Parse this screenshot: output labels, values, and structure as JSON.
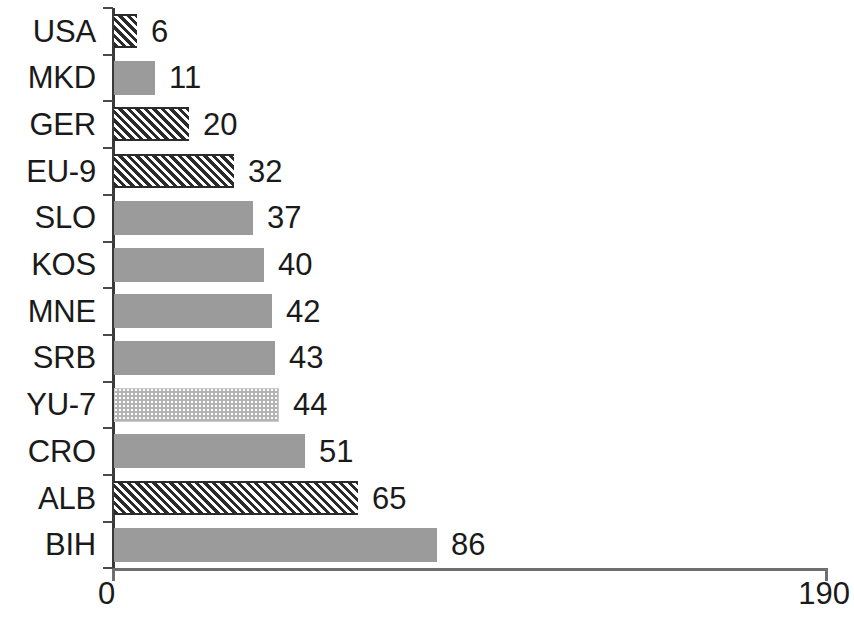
{
  "chart_data": {
    "type": "bar",
    "orientation": "horizontal",
    "title": "",
    "subtitle": "",
    "xlabel": "",
    "ylabel": "",
    "xlim": [
      0,
      190
    ],
    "grid": false,
    "legend": null,
    "axis": {
      "x_ticks": [
        0,
        190
      ],
      "x_tick_labels": [
        "0",
        "190"
      ],
      "y_tick_style": "boundary-ticks"
    },
    "categories": [
      "USA",
      "MKD",
      "GER",
      "EU-9",
      "SLO",
      "KOS",
      "MNE",
      "SRB",
      "YU-7",
      "CRO",
      "ALB",
      "BIH"
    ],
    "values": [
      6,
      11,
      20,
      32,
      37,
      40,
      42,
      43,
      44,
      51,
      65,
      86
    ],
    "value_labels": [
      "6",
      "11",
      "20",
      "32",
      "37",
      "40",
      "42",
      "43",
      "44",
      "51",
      "65",
      "86"
    ],
    "fills": [
      "hatch",
      "solid",
      "hatch",
      "hatch",
      "solid",
      "solid",
      "solid",
      "solid",
      "dots",
      "solid",
      "hatch",
      "solid"
    ],
    "bars": [
      {
        "category": "USA",
        "value": 6,
        "label": "6",
        "fill": "hatch"
      },
      {
        "category": "MKD",
        "value": 11,
        "label": "11",
        "fill": "solid"
      },
      {
        "category": "GER",
        "value": 20,
        "label": "20",
        "fill": "hatch"
      },
      {
        "category": "EU-9",
        "value": 32,
        "label": "32",
        "fill": "hatch"
      },
      {
        "category": "SLO",
        "value": 37,
        "label": "37",
        "fill": "solid"
      },
      {
        "category": "KOS",
        "value": 40,
        "label": "40",
        "fill": "solid"
      },
      {
        "category": "MNE",
        "value": 42,
        "label": "42",
        "fill": "solid"
      },
      {
        "category": "SRB",
        "value": 43,
        "label": "43",
        "fill": "solid"
      },
      {
        "category": "YU-7",
        "value": 44,
        "label": "44",
        "fill": "dots"
      },
      {
        "category": "CRO",
        "value": 51,
        "label": "51",
        "fill": "solid"
      },
      {
        "category": "ALB",
        "value": 65,
        "label": "65",
        "fill": "hatch"
      },
      {
        "category": "BIH",
        "value": 86,
        "label": "86",
        "fill": "solid"
      }
    ],
    "colors": {
      "solid_fill": "#9b9b9b",
      "hatch_line": "#2b2b2b",
      "dots_fill": "#b4b4b4",
      "axis": "#6f6f6f",
      "text": "#1a1a1a",
      "background": "#ffffff"
    }
  }
}
